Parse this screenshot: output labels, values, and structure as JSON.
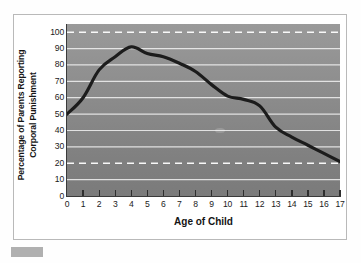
{
  "figure": {
    "top_artifact_text": "",
    "corner_swatch_color": "#b0b0b0",
    "frame_border_color": "#b9b9b9"
  },
  "chart_data": {
    "type": "line",
    "title": "",
    "xlabel": "Age of Child",
    "ylabel_line1": "Percentage of Parents Reporting",
    "ylabel_line2": "Corporal Punishment",
    "x": [
      0,
      1,
      2,
      3,
      4,
      5,
      6,
      7,
      8,
      9,
      10,
      11,
      12,
      13,
      14,
      15,
      16,
      17
    ],
    "values": [
      50,
      60,
      77,
      85,
      91,
      87,
      85,
      81,
      76,
      68,
      61,
      59,
      55,
      42,
      36,
      31,
      26,
      21
    ],
    "xlim": [
      0,
      17
    ],
    "ylim": [
      0,
      105
    ],
    "xticks": [
      "0",
      "1",
      "2",
      "3",
      "4",
      "5",
      "6",
      "7",
      "8",
      "9",
      "10",
      "11",
      "12",
      "13",
      "14",
      "15",
      "16",
      "17"
    ],
    "yticks": [
      "0",
      "10",
      "20",
      "30",
      "40",
      "50",
      "60",
      "70",
      "80",
      "90",
      "100"
    ],
    "ytick_values": [
      0,
      10,
      20,
      30,
      40,
      50,
      60,
      70,
      80,
      90,
      100
    ],
    "grid": true,
    "grid_color": "#f2f2f2",
    "dashed_gridlines": [
      20,
      100
    ],
    "dashed_grid_color": "#ffffff",
    "line_color": "#1c1c1c",
    "line_width": 3.2,
    "plot_bg_top": "#9a9a9a",
    "plot_bg_bottom": "#7b7b7b",
    "legend": [],
    "legend_position": "none",
    "annotations": []
  }
}
